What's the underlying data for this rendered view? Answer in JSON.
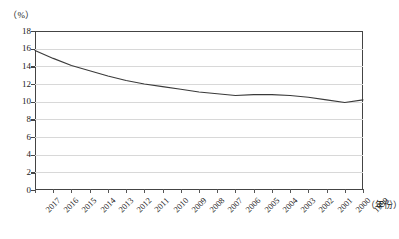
{
  "axes": {
    "y_unit_label": "（%）",
    "x_unit_label": "（年份）",
    "y_ticks": [
      "0",
      "2",
      "4",
      "6",
      "8",
      "10",
      "12",
      "14",
      "16",
      "18"
    ],
    "x_ticks": [
      "2017",
      "2016",
      "2015",
      "2014",
      "2013",
      "2012",
      "2011",
      "2010",
      "2009",
      "2008",
      "2007",
      "2006",
      "2005",
      "2004",
      "2003",
      "2002",
      "2001",
      "2000",
      "1999"
    ]
  },
  "colors": {
    "line": "#3a3a3a",
    "grid": "#d8d8d8",
    "axis": "#444444",
    "background": "#ffffff"
  },
  "chart_data": {
    "type": "line",
    "title": "",
    "subtitle": "",
    "xlabel": "（年份）",
    "ylabel": "（%）",
    "xlim_labels": [
      "2017",
      "1999"
    ],
    "ylim": [
      0,
      18
    ],
    "y_tick_step": 2,
    "grid": true,
    "legend": "none",
    "categories": [
      "2017",
      "2016",
      "2015",
      "2014",
      "2013",
      "2012",
      "2011",
      "2010",
      "2009",
      "2008",
      "2007",
      "2006",
      "2005",
      "2004",
      "2003",
      "2002",
      "2001",
      "2000",
      "1999"
    ],
    "series": [
      {
        "name": "比率",
        "values": [
          15.8,
          14.9,
          14.1,
          13.5,
          12.9,
          12.4,
          12.0,
          11.7,
          11.4,
          11.1,
          10.9,
          10.7,
          10.8,
          10.8,
          10.7,
          10.5,
          10.2,
          9.9,
          10.2
        ]
      }
    ]
  }
}
